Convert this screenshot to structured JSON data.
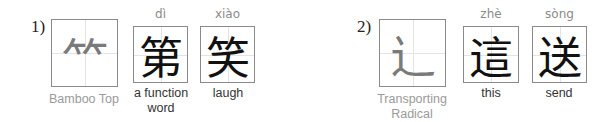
{
  "groups": [
    {
      "number": "1)",
      "radical": {
        "glyph": "⺮",
        "caption": "Bamboo Top"
      },
      "examples": [
        {
          "pinyin": "dì",
          "hanzi": "第",
          "meaning": "a function word"
        },
        {
          "pinyin": "xiào",
          "hanzi": "笑",
          "meaning": "laugh"
        }
      ]
    },
    {
      "number": "2)",
      "radical": {
        "glyph": "⻌",
        "caption": "Transporting Radical"
      },
      "examples": [
        {
          "pinyin": "zhè",
          "hanzi": "這",
          "meaning": "this"
        },
        {
          "pinyin": "sòng",
          "hanzi": "送",
          "meaning": "send"
        }
      ]
    }
  ]
}
